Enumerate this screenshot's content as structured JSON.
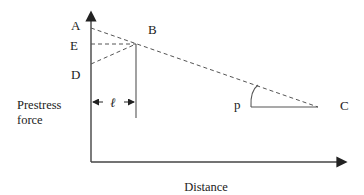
{
  "diagram": {
    "points": {
      "A": "A",
      "B": "B",
      "C": "C",
      "D": "D",
      "E": "E"
    },
    "angle_label": "p",
    "length_label": "ℓ",
    "y_axis_label_line1": "Prestress",
    "y_axis_label_line2": "force",
    "x_axis_label": "Distance"
  },
  "colors": {
    "line": "#444444",
    "dashed": "#555555",
    "text": "#222222"
  }
}
